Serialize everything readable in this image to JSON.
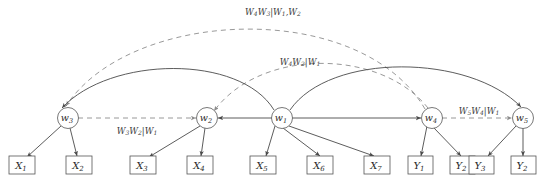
{
  "figure": {
    "type": "directed-acyclic-graph",
    "background_color": "#ffffff",
    "solid_edge_color": "#4a4a4a",
    "dashed_edge_color": "#8d8d8d",
    "node_stroke_color": "#555555",
    "text_color": "#2b2b2b"
  },
  "latent_nodes": [
    {
      "id": "w3",
      "base": "w",
      "sub": "3",
      "x": 68,
      "y": 118
    },
    {
      "id": "w2",
      "base": "w",
      "sub": "2",
      "x": 207,
      "y": 118
    },
    {
      "id": "w1",
      "base": "w",
      "sub": "1",
      "x": 282,
      "y": 118
    },
    {
      "id": "w4",
      "base": "w",
      "sub": "4",
      "x": 432,
      "y": 118
    },
    {
      "id": "w5",
      "base": "w",
      "sub": "5",
      "x": 523,
      "y": 118
    }
  ],
  "observed_nodes": [
    {
      "id": "X1",
      "base": "X",
      "sub": "1",
      "x": 22,
      "y": 165
    },
    {
      "id": "X2",
      "base": "X",
      "sub": "2",
      "x": 79,
      "y": 165
    },
    {
      "id": "X3",
      "base": "X",
      "sub": "3",
      "x": 143,
      "y": 165
    },
    {
      "id": "X4",
      "base": "X",
      "sub": "4",
      "x": 200,
      "y": 165
    },
    {
      "id": "X5",
      "base": "X",
      "sub": "5",
      "x": 263,
      "y": 165
    },
    {
      "id": "X6",
      "base": "X",
      "sub": "6",
      "x": 320,
      "y": 165
    },
    {
      "id": "X7",
      "base": "X",
      "sub": "7",
      "x": 377,
      "y": 165
    },
    {
      "id": "Y1",
      "base": "Y",
      "sub": "1",
      "x": 420,
      "y": 165
    },
    {
      "id": "Y2",
      "base": "Y",
      "sub": "2",
      "x": 462,
      "y": 165
    },
    {
      "id": "Y3",
      "base": "Y",
      "sub": "3",
      "x": 481,
      "y": 165
    },
    {
      "id": "Y4",
      "base": "Y",
      "sub": "2",
      "x": 523,
      "y": 165
    }
  ],
  "edge_labels": [
    {
      "id": "label-w4w3-given-w1w2",
      "text": "W4W3|W1,W2",
      "x": 273,
      "y": 12,
      "parts": [
        {
          "t": "W",
          "s": "4"
        },
        {
          "t": "W",
          "s": "3"
        },
        {
          "t": "|",
          "s": ""
        },
        {
          "t": "W",
          "s": "1"
        },
        {
          "t": ",",
          "s": ""
        },
        {
          "t": "W",
          "s": "2"
        }
      ]
    },
    {
      "id": "label-w4w2-given-w1",
      "text": "W4W2|W1",
      "x": 300,
      "y": 62,
      "parts": [
        {
          "t": "W",
          "s": "4"
        },
        {
          "t": "W",
          "s": "2"
        },
        {
          "t": "|",
          "s": ""
        },
        {
          "t": "W",
          "s": "1"
        }
      ]
    },
    {
      "id": "label-w3w2-given-w1",
      "text": "W3W2|W1",
      "x": 137,
      "y": 131,
      "parts": [
        {
          "t": "W",
          "s": "3"
        },
        {
          "t": "W",
          "s": "2"
        },
        {
          "t": "|",
          "s": ""
        },
        {
          "t": "W",
          "s": "1"
        }
      ]
    },
    {
      "id": "label-w5w4-given-w1",
      "text": "W5W4|W1",
      "x": 479,
      "y": 111,
      "parts": [
        {
          "t": "W",
          "s": "5"
        },
        {
          "t": "W",
          "s": "4"
        },
        {
          "t": "|",
          "s": ""
        },
        {
          "t": "W",
          "s": "1"
        }
      ]
    }
  ],
  "solid_edges": [
    {
      "id": "w1-to-w2",
      "from": "w1",
      "to": "w2",
      "style": "straight"
    },
    {
      "id": "w1-to-w4",
      "from": "w1",
      "to": "w4",
      "style": "straight"
    },
    {
      "id": "w1-to-w3",
      "from": "w1",
      "to": "w3",
      "style": "arc"
    },
    {
      "id": "w1-to-w5",
      "from": "w1",
      "to": "w5",
      "style": "arc"
    },
    {
      "id": "w3-to-X1",
      "from": "w3",
      "to": "X1",
      "style": "straight"
    },
    {
      "id": "w3-to-X2",
      "from": "w3",
      "to": "X2",
      "style": "straight"
    },
    {
      "id": "w2-to-X3",
      "from": "w2",
      "to": "X3",
      "style": "straight"
    },
    {
      "id": "w2-to-X4",
      "from": "w2",
      "to": "X4",
      "style": "straight"
    },
    {
      "id": "w1-to-X5",
      "from": "w1",
      "to": "X5",
      "style": "straight"
    },
    {
      "id": "w1-to-X6",
      "from": "w1",
      "to": "X6",
      "style": "straight"
    },
    {
      "id": "w1-to-X7",
      "from": "w1",
      "to": "X7",
      "style": "straight"
    },
    {
      "id": "w4-to-Y1",
      "from": "w4",
      "to": "Y1",
      "style": "straight"
    },
    {
      "id": "w4-to-Y2",
      "from": "w4",
      "to": "Y2",
      "style": "straight"
    },
    {
      "id": "w5-to-Y3",
      "from": "w5",
      "to": "Y3",
      "style": "straight"
    },
    {
      "id": "w5-to-Y4",
      "from": "w5",
      "to": "Y4",
      "style": "straight"
    }
  ],
  "dashed_edges": [
    {
      "id": "w4-to-w3-arc",
      "from": "w4",
      "to": "w3",
      "label": "W4W3|W1,W2"
    },
    {
      "id": "w4-to-w2-arc",
      "from": "w4",
      "to": "w2",
      "label": "W4W2|W1"
    },
    {
      "id": "w3-to-w2-straight",
      "from": "w3",
      "to": "w2",
      "label": "W3W2|W1"
    },
    {
      "id": "w4-to-w5-straight",
      "from": "w4",
      "to": "w5",
      "label": "W5W4|W1"
    }
  ]
}
